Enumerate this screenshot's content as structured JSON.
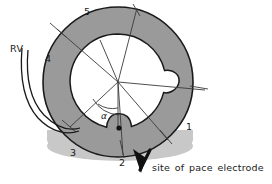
{
  "figure": {
    "type": "anatomical-cross-section-diagram",
    "background_color": "#ffffff",
    "ring": {
      "fill_color": "#9a9a9a",
      "stroke_color": "#1a1a1a",
      "inner_fill_color": "#ffffff",
      "shadow_color": "#c8c8c8",
      "center": {
        "x": 118,
        "y": 82
      },
      "outer_radius": 75,
      "inner_radius": 48
    },
    "notches": [
      {
        "name": "right-notch",
        "angle_deg": 0,
        "depth": 14,
        "label": "right wall indentation"
      },
      {
        "name": "bottom-notch",
        "angle_deg": 90,
        "depth": 12,
        "label": "inferior wall indentation / pace electrode site"
      }
    ]
  },
  "labels": {
    "rv": "RV",
    "segment_1": "1",
    "segment_2": "2",
    "segment_3": "3",
    "segment_4": "4",
    "segment_5": "5",
    "angle": "α"
  },
  "caption": {
    "text": "site of pace electrode",
    "arrow": {
      "name": "pace-electrode-arrow",
      "color": "#111111",
      "points_to": "bottom-notch"
    }
  },
  "annotations": {
    "radial_lines_count": 6,
    "angle_arc_label": "α",
    "rv_lead_curves": 2
  },
  "colors": {
    "ink": "#1a1a1a",
    "myocardium_gray": "#9a9a9a",
    "shadow_gray": "#c8c8c8",
    "cavity_white": "#ffffff"
  }
}
